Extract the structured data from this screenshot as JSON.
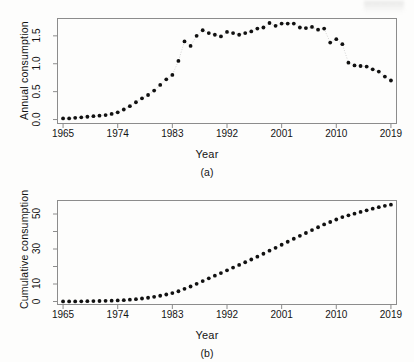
{
  "figure": {
    "background": "#fdfdfc",
    "point_color": "#111111",
    "axis_color": "#8c8c8c",
    "connector_color": "#c9c9c9"
  },
  "panels": [
    {
      "id": "a",
      "caption": "(a)",
      "xlabel": "Year",
      "ylabel": "Annual consumption"
    },
    {
      "id": "b",
      "caption": "(b)",
      "xlabel": "Year",
      "ylabel": "Cumulative consumption"
    }
  ],
  "chart_data": [
    {
      "type": "scatter",
      "title": "",
      "panel": "(a)",
      "xlabel": "Year",
      "ylabel": "Annual consumption",
      "xlim": [
        1964,
        2020
      ],
      "ylim": [
        -0.08,
        1.82
      ],
      "xticks": [
        1965,
        1974,
        1983,
        1992,
        2001,
        2010,
        2019
      ],
      "xtick_labels": [
        "1965",
        "1974",
        "1983",
        "1992",
        "2001",
        "2010",
        "2019"
      ],
      "yticks": [
        0.0,
        0.5,
        1.0,
        1.5
      ],
      "ytick_labels": [
        "0.0",
        "0.5",
        "1.0",
        "1.5"
      ],
      "grid": false,
      "legend": null,
      "connector": "dotted",
      "x": [
        1965,
        1966,
        1967,
        1968,
        1969,
        1970,
        1971,
        1972,
        1973,
        1974,
        1975,
        1976,
        1977,
        1978,
        1979,
        1980,
        1981,
        1982,
        1983,
        1984,
        1985,
        1986,
        1987,
        1988,
        1989,
        1990,
        1991,
        1992,
        1993,
        1994,
        1995,
        1996,
        1997,
        1998,
        1999,
        2000,
        2001,
        2002,
        2003,
        2004,
        2005,
        2006,
        2007,
        2008,
        2009,
        2010,
        2011,
        2012,
        2013,
        2014,
        2015,
        2016,
        2017,
        2018,
        2019
      ],
      "values": [
        0.02,
        0.02,
        0.03,
        0.04,
        0.05,
        0.06,
        0.07,
        0.08,
        0.1,
        0.13,
        0.18,
        0.24,
        0.31,
        0.38,
        0.44,
        0.52,
        0.62,
        0.72,
        0.8,
        1.05,
        1.4,
        1.32,
        1.5,
        1.6,
        1.55,
        1.52,
        1.49,
        1.57,
        1.55,
        1.52,
        1.55,
        1.58,
        1.63,
        1.65,
        1.73,
        1.68,
        1.72,
        1.72,
        1.72,
        1.65,
        1.64,
        1.66,
        1.61,
        1.63,
        1.38,
        1.44,
        1.35,
        1.02,
        0.97,
        0.96,
        0.95,
        0.9,
        0.86,
        0.77,
        0.7
      ]
    },
    {
      "type": "scatter",
      "title": "",
      "panel": "(b)",
      "xlabel": "Year",
      "ylabel": "Cumulative consumption",
      "xlim": [
        1964,
        2020
      ],
      "ylim": [
        -2.0,
        58.0
      ],
      "xticks": [
        1965,
        1974,
        1983,
        1992,
        2001,
        2010,
        2019
      ],
      "xtick_labels": [
        "1965",
        "1974",
        "1983",
        "1992",
        "2001",
        "2010",
        "2019"
      ],
      "yticks": [
        0,
        10,
        20,
        30,
        40,
        50
      ],
      "ytick_labels": [
        "0",
        "10",
        "",
        "30",
        "",
        "50"
      ],
      "grid": false,
      "legend": null,
      "connector": "none",
      "x": [
        1965,
        1966,
        1967,
        1968,
        1969,
        1970,
        1971,
        1972,
        1973,
        1974,
        1975,
        1976,
        1977,
        1978,
        1979,
        1980,
        1981,
        1982,
        1983,
        1984,
        1985,
        1986,
        1987,
        1988,
        1989,
        1990,
        1991,
        1992,
        1993,
        1994,
        1995,
        1996,
        1997,
        1998,
        1999,
        2000,
        2001,
        2002,
        2003,
        2004,
        2005,
        2006,
        2007,
        2008,
        2009,
        2010,
        2011,
        2012,
        2013,
        2014,
        2015,
        2016,
        2017,
        2018,
        2019
      ],
      "values": [
        0.02,
        0.04,
        0.07,
        0.11,
        0.16,
        0.22,
        0.29,
        0.37,
        0.47,
        0.6,
        0.78,
        1.02,
        1.33,
        1.71,
        2.15,
        2.67,
        3.29,
        4.01,
        4.81,
        5.86,
        7.26,
        8.58,
        10.08,
        11.68,
        13.23,
        14.75,
        16.24,
        17.81,
        19.36,
        20.88,
        22.43,
        24.01,
        25.64,
        27.29,
        29.02,
        30.7,
        32.42,
        34.14,
        35.86,
        37.51,
        39.15,
        40.81,
        42.42,
        44.05,
        45.43,
        46.87,
        48.22,
        49.24,
        50.21,
        51.17,
        52.12,
        53.02,
        53.88,
        54.65,
        55.35
      ]
    }
  ]
}
